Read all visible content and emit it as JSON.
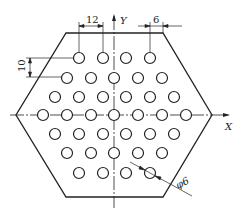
{
  "diagram": {
    "axes": {
      "x_label": "X",
      "y_label": "Y"
    },
    "dimensions": {
      "horizontal_pitch": "12",
      "edge_margin": "6",
      "vertical_pitch": "10",
      "hole_diameter": "φ6"
    },
    "hole_rows": [
      {
        "y": 58,
        "xs": [
          79,
          103,
          126,
          150
        ]
      },
      {
        "y": 78,
        "xs": [
          67,
          91,
          114,
          138,
          162
        ]
      },
      {
        "y": 97,
        "xs": [
          55,
          79,
          103,
          126,
          150,
          174
        ]
      },
      {
        "y": 115,
        "xs": [
          43,
          67,
          91,
          114,
          138,
          162,
          186
        ]
      },
      {
        "y": 134,
        "xs": [
          55,
          79,
          103,
          126,
          150,
          174
        ]
      },
      {
        "y": 153,
        "xs": [
          67,
          91,
          114,
          138,
          162
        ]
      },
      {
        "y": 173,
        "xs": [
          79,
          103,
          126,
          150
        ]
      }
    ],
    "colors": {
      "line": "#222222",
      "background": "#ffffff"
    }
  }
}
